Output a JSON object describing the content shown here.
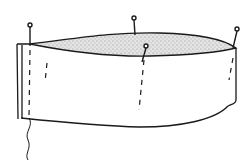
{
  "diagram": {
    "colors": {
      "ink": "#1a1a1a",
      "fill": "#c8c8c8",
      "background": "#ffffff"
    },
    "pins": 4
  }
}
